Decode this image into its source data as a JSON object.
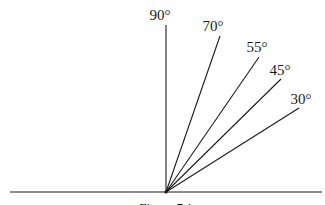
{
  "diagram": {
    "origin": {
      "x": 166,
      "y": 192
    },
    "baseline": {
      "x1": 10,
      "x2": 322,
      "y": 192
    },
    "line_color": "#1a1a1a",
    "rays": [
      {
        "angle": "90°",
        "x2": 166,
        "y2": 25,
        "label_x": 160,
        "label_y": 20
      },
      {
        "angle": "70°",
        "x2": 220,
        "y2": 36,
        "label_x": 213,
        "label_y": 31
      },
      {
        "angle": "55°",
        "x2": 259,
        "y2": 57,
        "label_x": 257,
        "label_y": 52
      },
      {
        "angle": "45°",
        "x2": 281,
        "y2": 79,
        "label_x": 280,
        "label_y": 75
      },
      {
        "angle": "30°",
        "x2": 299,
        "y2": 108,
        "label_x": 301,
        "label_y": 104
      }
    ],
    "caption": "Figure 7.1"
  }
}
